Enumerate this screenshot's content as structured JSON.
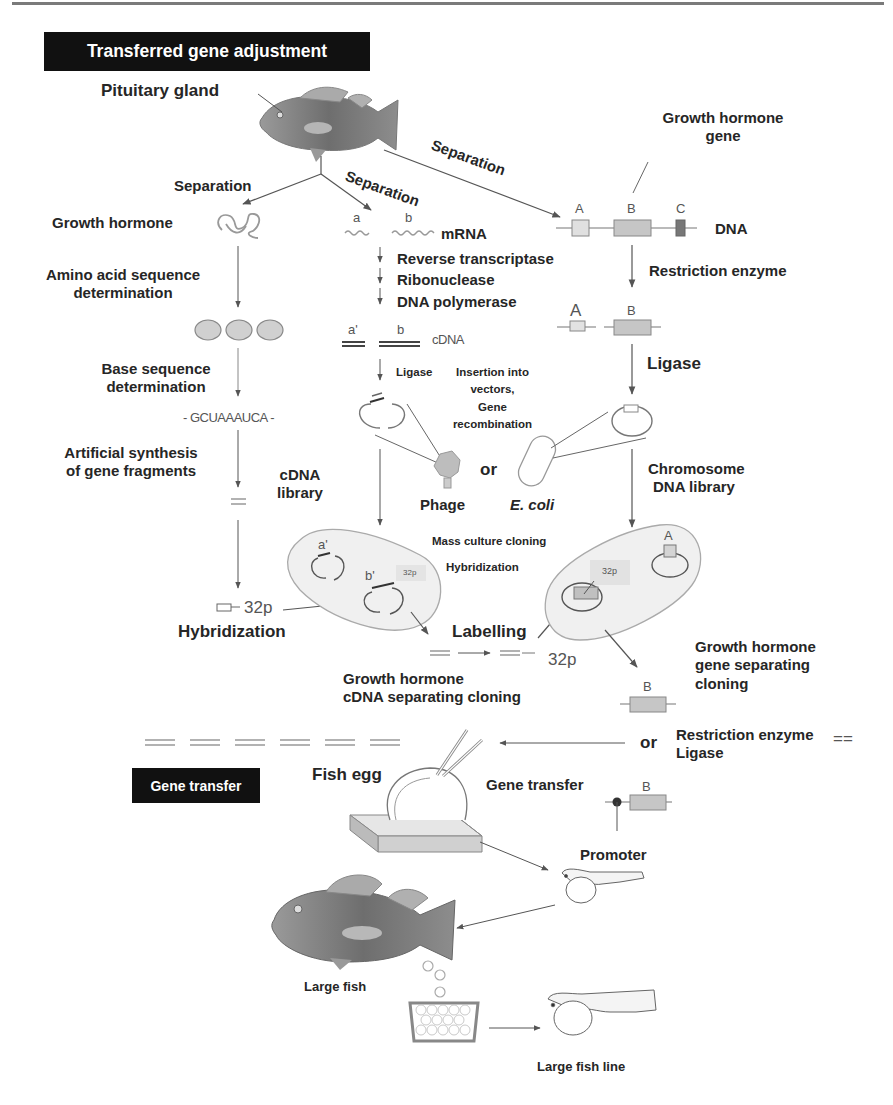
{
  "sections": {
    "transferred_gene_adjustment": "Transferred gene adjustment",
    "gene_transfer": "Gene transfer"
  },
  "labels": {
    "pituitary_gland": "Pituitary gland",
    "growth_hormone_gene_line1": "Growth hormone",
    "growth_hormone_gene_line2": "gene",
    "separation_left": "Separation",
    "separation_middle": "Separation",
    "separation_right": "Separation",
    "growth_hormone": "Growth hormone",
    "amino_acid_line1": "Amino  acid sequence",
    "amino_acid_line2": "determination",
    "base_seq_line1": "Base sequence",
    "base_seq_line2": "determination",
    "base_sequence": "- GCUAAAUCA -",
    "artificial_line1": "Artificial synthesis",
    "artificial_line2": "of gene fragments",
    "mrna_a": "a",
    "mrna_b": "b",
    "mrna": "mRNA",
    "reverse_transcriptase": "Reverse transcriptase",
    "ribonuclease": "Ribonuclease",
    "dna_polymerase": "DNA polymerase",
    "cdna_a": "a'",
    "cdna_b": "b",
    "cdna": "cDNA",
    "ligase_small": "Ligase",
    "insertion_line1": "Insertion into",
    "insertion_line2": "vectors,",
    "insertion_line3": "Gene",
    "insertion_line4": "recombination",
    "dna_gene_a": "A",
    "dna_gene_b": "B",
    "dna_gene_c": "C",
    "dna": "DNA",
    "restriction_enzyme": "Restriction  enzyme",
    "cut_a": "A",
    "cut_b": "B",
    "ligase_big": "Ligase",
    "or_vectors": "or",
    "phage": "Phage",
    "ecoli": "E. coli",
    "cdna_library_line1": "cDNA",
    "cdna_library_line2": "library",
    "chromosome_line1": "Chromosome",
    "chromosome_line2": "DNA library",
    "mass_culture": "Mass culture cloning",
    "hybridization_mid": "Hybridization",
    "lib_a_prime": "a'",
    "lib_b_prime": "b'",
    "p32_small_left": "32p",
    "chrom_a": "A",
    "p32_small_right": "32p",
    "p32_probe": "32p",
    "hybridization_left": "Hybridization",
    "labelling": "Labelling",
    "p32_labelling": "32p",
    "gh_cdna_line1": "Growth hormone",
    "gh_cdna_line2": "cDNA  separating cloning",
    "gh_gene_line1": "Growth hormone",
    "gh_gene_line2": "gene separating",
    "gh_gene_line3": "cloning",
    "separated_b": "B",
    "or_bottom": "or",
    "restriction_enzyme2": "Restriction  enzyme",
    "ligase2": "Ligase",
    "double_line": "==",
    "fish_egg": "Fish egg",
    "gene_transfer_step": "Gene transfer",
    "promoter_b": "B",
    "promoter": "Promoter",
    "large_fish": "Large fish",
    "large_fish_line": "Large fish  line"
  },
  "icons": [
    "fish-adult-icon",
    "protein-coil-icon",
    "amino-acid-beads-icon",
    "plasmid-icon",
    "phage-icon",
    "ecoli-icon",
    "bacterial-colony-icon",
    "microinjection-egg-icon",
    "larva-icon",
    "egg-dish-icon",
    "large-fish-icon"
  ],
  "colors": {
    "ink": "#262626",
    "line": "#555555",
    "fill_light": "#e6e6e6",
    "fill_mid": "#c8c8c8",
    "fill_dark": "#8a8a8a",
    "badge": "#111111"
  }
}
